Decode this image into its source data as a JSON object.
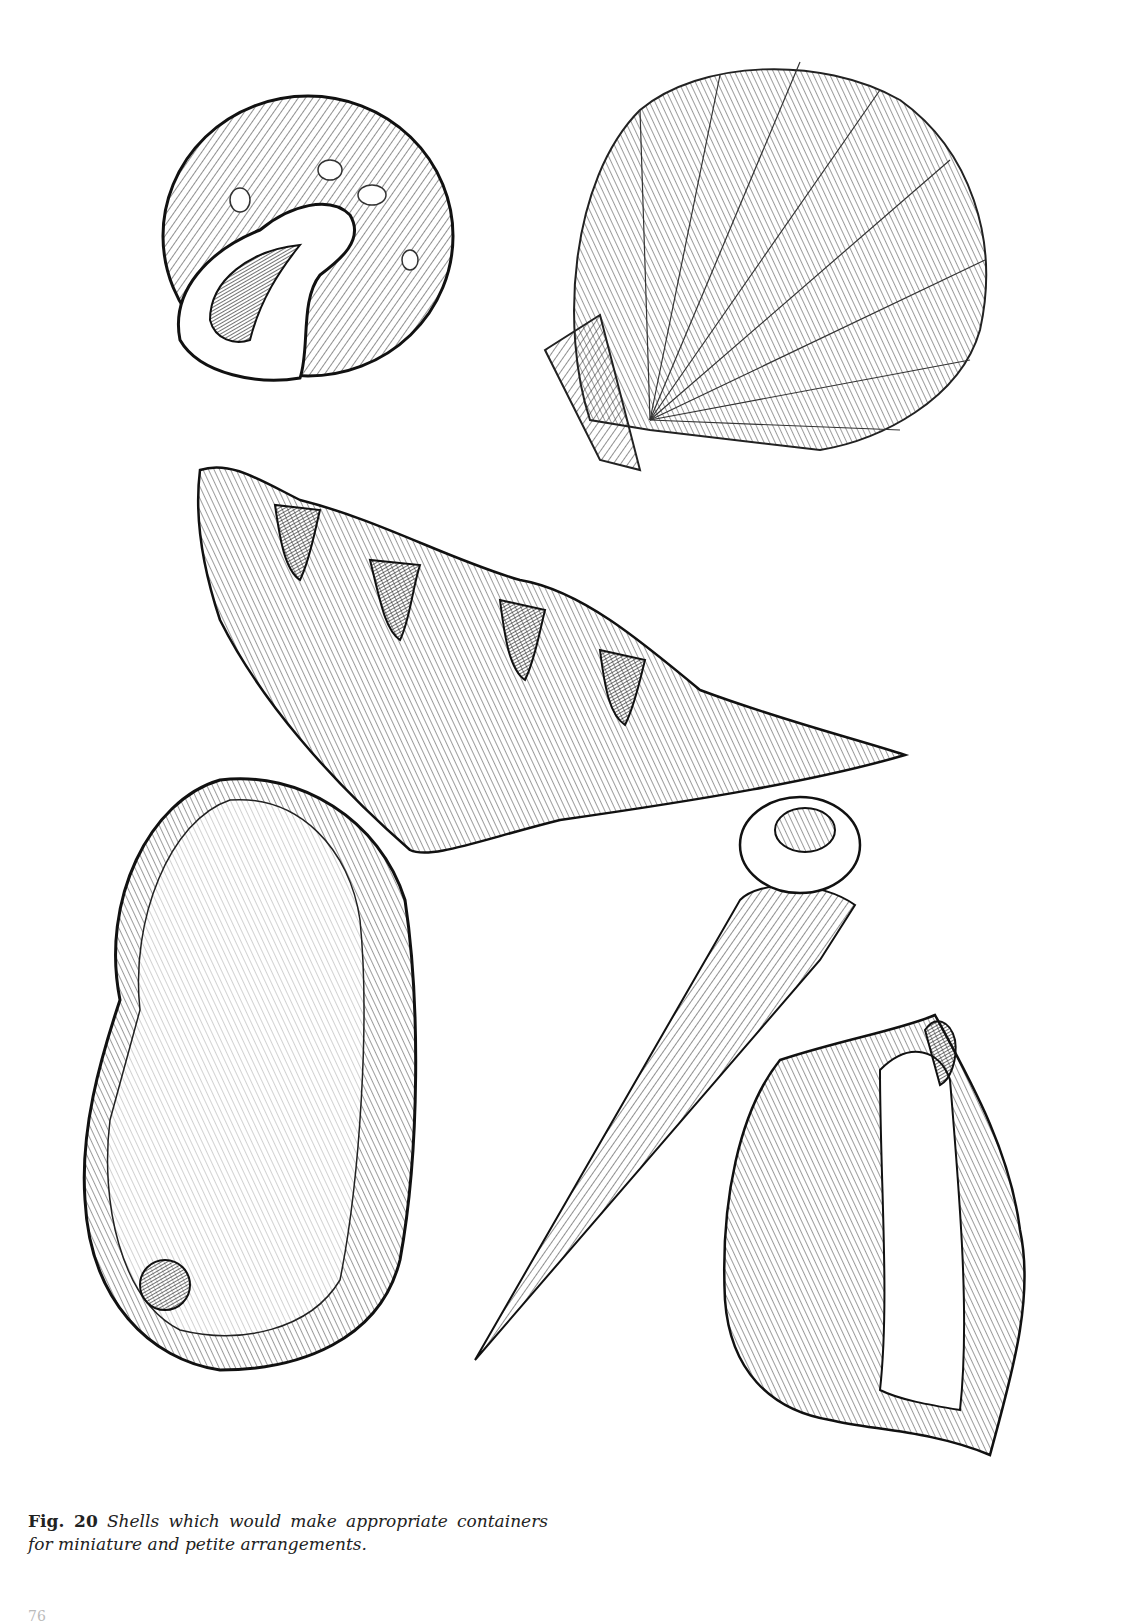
{
  "figure": {
    "label": "Fig. 20",
    "caption": "Shells which would make appropriate containers for miniature and petite arrangements.",
    "caption_line1": "Shells which would make appropriate con-",
    "caption_line2": "tainers for miniature and petite arrangements."
  },
  "illustration": {
    "description": "Pen-and-ink drawings of six shells",
    "shells": [
      {
        "name": "moon-snail-shell",
        "position": "top-left"
      },
      {
        "name": "scallop-shell",
        "position": "top-right"
      },
      {
        "name": "giant-clam-shell",
        "position": "center"
      },
      {
        "name": "abalone-shell",
        "position": "bottom-left"
      },
      {
        "name": "auger-turret-shell",
        "position": "bottom-center"
      },
      {
        "name": "conch-shell",
        "position": "bottom-right"
      }
    ],
    "ink_color": "#1a1a1a",
    "paper_color": "#ffffff"
  },
  "page": {
    "number_partial": "76"
  }
}
